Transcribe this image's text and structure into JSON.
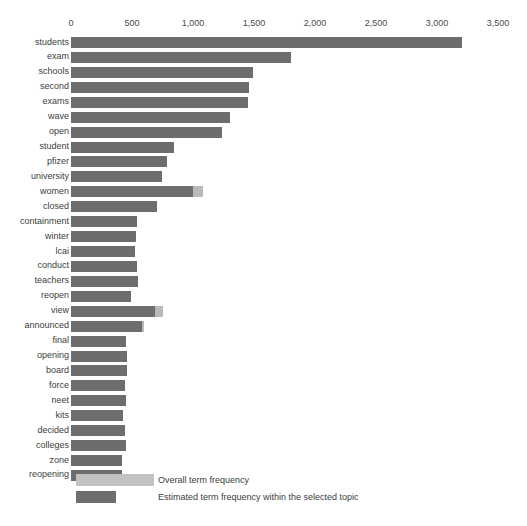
{
  "chart_data": {
    "type": "bar",
    "orientation": "horizontal",
    "title": "",
    "subtitle": "",
    "xlabel": "",
    "ylabel": "",
    "xlim": [
      0,
      3500
    ],
    "grid": false,
    "legend_position": "bottom-left",
    "x_ticks": [
      {
        "value": 0,
        "label": "0"
      },
      {
        "value": 500,
        "label": "500"
      },
      {
        "value": 1000,
        "label": "1,000"
      },
      {
        "value": 1500,
        "label": "1,500"
      },
      {
        "value": 2000,
        "label": "2,000"
      },
      {
        "value": 2500,
        "label": "2,500"
      },
      {
        "value": 3000,
        "label": "3,000"
      },
      {
        "value": 3500,
        "label": "3,500"
      }
    ],
    "categories": [
      "students",
      "exam",
      "schools",
      "second",
      "exams",
      "wave",
      "open",
      "student",
      "pfizer",
      "university",
      "women",
      "closed",
      "containment",
      "winter",
      "lcai",
      "conduct",
      "teachers",
      "reopen",
      "view",
      "announced",
      "final",
      "opening",
      "board",
      "force",
      "neet",
      "kits",
      "decided",
      "colleges",
      "zone",
      "reopening"
    ],
    "series": [
      {
        "name": "Overall term frequency",
        "color": "#b9b9b9",
        "values": [
          3205,
          1803,
          1492,
          1459,
          1451,
          1303,
          1238,
          845,
          787,
          746,
          1082,
          705,
          541,
          533,
          525,
          541,
          549,
          492,
          754,
          599,
          451,
          459,
          459,
          443,
          451,
          427,
          443,
          451,
          418,
          418
        ]
      },
      {
        "name": "Estimated term frequency within the selected topic",
        "color": "#6d6d6d",
        "values": [
          3205,
          1803,
          1492,
          1459,
          1451,
          1303,
          1238,
          845,
          787,
          746,
          1000,
          705,
          541,
          533,
          525,
          541,
          549,
          492,
          688,
          582,
          451,
          459,
          459,
          443,
          451,
          427,
          443,
          451,
          418,
          418
        ]
      }
    ]
  },
  "axis": {
    "labels": [
      "0",
      "500",
      "1,000",
      "1,500",
      "2,000",
      "2,500",
      "3,000",
      "3,500"
    ]
  },
  "legend": {
    "overall_label": "Overall term frequency",
    "estimated_label": "Estimated term frequency within the selected topic",
    "overall_color": "#c2c2c2",
    "estimated_color": "#6d6d6d"
  }
}
